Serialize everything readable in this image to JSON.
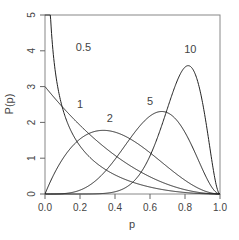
{
  "chart_data": {
    "type": "line",
    "title": "",
    "xlabel": "p",
    "ylabel": "P(p)",
    "xlim": [
      0,
      1
    ],
    "ylim": [
      0,
      5
    ],
    "xticks": [
      "0.0",
      "0.2",
      "0.4",
      "0.6",
      "0.8",
      "1.0"
    ],
    "yticks": [
      "0",
      "1",
      "2",
      "3",
      "4",
      "5"
    ],
    "grid": false,
    "legend": "inline curve labels",
    "series": [
      {
        "name": "0.5",
        "a": 0.5,
        "b": 3,
        "label_pos": [
          0.22,
          4.0
        ]
      },
      {
        "name": "1",
        "a": 1,
        "b": 3,
        "label_pos": [
          0.2,
          2.4
        ]
      },
      {
        "name": "2",
        "a": 2,
        "b": 3,
        "label_pos": [
          0.37,
          2.0
        ]
      },
      {
        "name": "5",
        "a": 5,
        "b": 3,
        "label_pos": [
          0.6,
          2.5
        ]
      },
      {
        "name": "10",
        "a": 10,
        "b": 3,
        "label_pos": [
          0.83,
          3.95
        ]
      }
    ]
  }
}
